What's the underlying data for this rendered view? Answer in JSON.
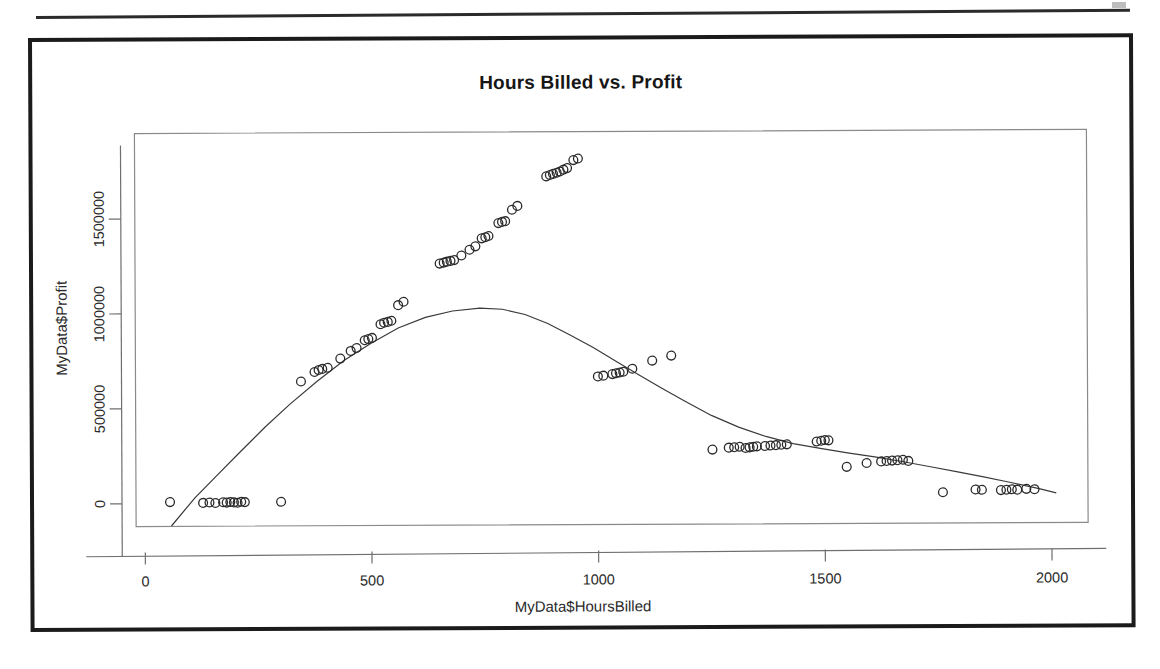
{
  "page": {
    "rule_visible": true
  },
  "chart_data": {
    "type": "scatter",
    "title": "Hours Billed vs. Profit",
    "xlabel": "MyData$HoursBilled",
    "ylabel": "MyData$Profit",
    "xlim": [
      -20,
      2080
    ],
    "ylim": [
      -120000,
      1950000
    ],
    "xticks": [
      0,
      500,
      1000,
      1500,
      2000
    ],
    "xticklabels": [
      "0",
      "500",
      "1000",
      "1500",
      "2000"
    ],
    "yticks": [
      0,
      500000,
      1000000,
      1500000
    ],
    "yticklabels": [
      "0",
      "500000",
      "1000000",
      "1500000"
    ],
    "grid": false,
    "legend": null,
    "marker": "open-circle",
    "point_color": "#2a2a2a",
    "curve_color": "#3a3a3a",
    "curve_label": "loess smooth",
    "points": [
      [
        55,
        8000
      ],
      [
        128,
        3000
      ],
      [
        142,
        5000
      ],
      [
        155,
        2000
      ],
      [
        172,
        6000
      ],
      [
        180,
        4000
      ],
      [
        188,
        7000
      ],
      [
        196,
        5000
      ],
      [
        204,
        3000
      ],
      [
        212,
        8000
      ],
      [
        220,
        6000
      ],
      [
        300,
        7000
      ],
      [
        345,
        640000
      ],
      [
        375,
        690000
      ],
      [
        384,
        700000
      ],
      [
        392,
        706000
      ],
      [
        404,
        712000
      ],
      [
        432,
        760000
      ],
      [
        455,
        800000
      ],
      [
        468,
        815000
      ],
      [
        486,
        856000
      ],
      [
        494,
        862000
      ],
      [
        502,
        868000
      ],
      [
        521,
        940000
      ],
      [
        529,
        948000
      ],
      [
        537,
        952000
      ],
      [
        545,
        958000
      ],
      [
        560,
        1040000
      ],
      [
        572,
        1058000
      ],
      [
        652,
        1258000
      ],
      [
        661,
        1263000
      ],
      [
        668,
        1268000
      ],
      [
        676,
        1272000
      ],
      [
        684,
        1276000
      ],
      [
        700,
        1300000
      ],
      [
        718,
        1330000
      ],
      [
        731,
        1348000
      ],
      [
        745,
        1390000
      ],
      [
        753,
        1396000
      ],
      [
        760,
        1402000
      ],
      [
        782,
        1470000
      ],
      [
        790,
        1476000
      ],
      [
        797,
        1480000
      ],
      [
        812,
        1540000
      ],
      [
        824,
        1560000
      ],
      [
        888,
        1715000
      ],
      [
        896,
        1722000
      ],
      [
        903,
        1728000
      ],
      [
        911,
        1734000
      ],
      [
        918,
        1740000
      ],
      [
        926,
        1750000
      ],
      [
        934,
        1758000
      ],
      [
        948,
        1800000
      ],
      [
        958,
        1808000
      ],
      [
        1000,
        660000
      ],
      [
        1012,
        664000
      ],
      [
        1032,
        672000
      ],
      [
        1040,
        676000
      ],
      [
        1048,
        680000
      ],
      [
        1056,
        684000
      ],
      [
        1076,
        700000
      ],
      [
        1120,
        742000
      ],
      [
        1162,
        768000
      ],
      [
        1252,
        272000
      ],
      [
        1288,
        282000
      ],
      [
        1300,
        284000
      ],
      [
        1312,
        286000
      ],
      [
        1325,
        280000
      ],
      [
        1334,
        283000
      ],
      [
        1342,
        286000
      ],
      [
        1350,
        288000
      ],
      [
        1368,
        290000
      ],
      [
        1380,
        292000
      ],
      [
        1392,
        294000
      ],
      [
        1404,
        296000
      ],
      [
        1416,
        298000
      ],
      [
        1482,
        312000
      ],
      [
        1492,
        316000
      ],
      [
        1500,
        320000
      ],
      [
        1508,
        318000
      ],
      [
        1548,
        178000
      ],
      [
        1592,
        198000
      ],
      [
        1624,
        206000
      ],
      [
        1636,
        208000
      ],
      [
        1648,
        210000
      ],
      [
        1660,
        212000
      ],
      [
        1672,
        214000
      ],
      [
        1684,
        208000
      ],
      [
        1760,
        42000
      ],
      [
        1832,
        56000
      ],
      [
        1846,
        54000
      ],
      [
        1888,
        52000
      ],
      [
        1900,
        54000
      ],
      [
        1912,
        56000
      ],
      [
        1924,
        54000
      ],
      [
        1944,
        58000
      ],
      [
        1962,
        56000
      ]
    ],
    "curve": [
      [
        58,
        -118000
      ],
      [
        110,
        30000
      ],
      [
        160,
        150000
      ],
      [
        210,
        270000
      ],
      [
        265,
        400000
      ],
      [
        320,
        520000
      ],
      [
        380,
        640000
      ],
      [
        440,
        750000
      ],
      [
        500,
        840000
      ],
      [
        560,
        920000
      ],
      [
        620,
        975000
      ],
      [
        680,
        1008000
      ],
      [
        740,
        1022000
      ],
      [
        790,
        1016000
      ],
      [
        840,
        988000
      ],
      [
        890,
        940000
      ],
      [
        940,
        878000
      ],
      [
        990,
        812000
      ],
      [
        1040,
        740000
      ],
      [
        1090,
        668000
      ],
      [
        1140,
        598000
      ],
      [
        1190,
        530000
      ],
      [
        1250,
        452000
      ],
      [
        1310,
        390000
      ],
      [
        1370,
        340000
      ],
      [
        1430,
        302000
      ],
      [
        1490,
        276000
      ],
      [
        1550,
        252000
      ],
      [
        1610,
        230000
      ],
      [
        1670,
        205000
      ],
      [
        1730,
        178000
      ],
      [
        1790,
        150000
      ],
      [
        1850,
        122000
      ],
      [
        1910,
        92000
      ],
      [
        1970,
        60000
      ],
      [
        2010,
        36000
      ]
    ]
  }
}
